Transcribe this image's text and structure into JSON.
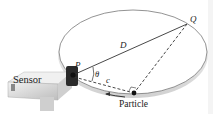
{
  "diagram": {
    "labels": {
      "sensor": "Sensor",
      "p": "P",
      "q": "Q",
      "d": "D",
      "theta": "θ",
      "c": "c",
      "particle": "Particle"
    },
    "colors": {
      "stroke": "#444444",
      "sensor_body": "#e6e6e6",
      "sensor_dark": "#222222"
    }
  }
}
